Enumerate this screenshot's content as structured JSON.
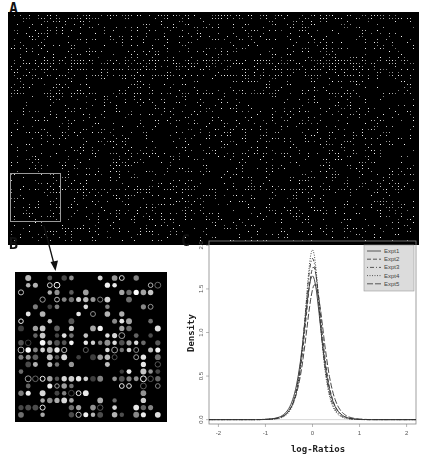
{
  "figure": {
    "panel_labels": {
      "a": "A",
      "b": "B",
      "c": "C"
    },
    "panel_a": {
      "description": "Full microarray scan image (dark background with bright spots)",
      "background": "#000000",
      "spot_color": "#e8e8e8",
      "highlight_box_color": "#9a9a9a"
    },
    "panel_b": {
      "description": "Enlarged sub-grid of microarray spots",
      "background": "#000000",
      "rows": 20,
      "cols": 20
    },
    "arrow": {
      "from": "panel-a-highlight",
      "to": "panel-b",
      "color": "#111111"
    }
  },
  "chart_data": {
    "type": "line",
    "title": "",
    "xlabel": "log-Ratios",
    "ylabel": "Density",
    "xlim": [
      -2.2,
      2.2
    ],
    "ylim": [
      -0.05,
      2.05
    ],
    "xticks": [
      "-2",
      "-1",
      "0",
      "1",
      "2"
    ],
    "yticks": [
      "0.0",
      "0.5",
      "1.0",
      "1.5",
      "2.0"
    ],
    "grid": false,
    "legend_position": "top-right",
    "horizontal_reference_line": 0,
    "series": [
      {
        "name": "Expt1",
        "style": "solid",
        "peak_x": 0.0,
        "peak_density": 1.65,
        "approx_sd": 0.21
      },
      {
        "name": "Expt2",
        "style": "dashed",
        "peak_x": 0.02,
        "peak_density": 1.75,
        "approx_sd": 0.2
      },
      {
        "name": "Expt3",
        "style": "dotdash",
        "peak_x": 0.0,
        "peak_density": 1.85,
        "approx_sd": 0.19
      },
      {
        "name": "Expt4",
        "style": "dotted",
        "peak_x": 0.0,
        "peak_density": 1.95,
        "approx_sd": 0.18
      },
      {
        "name": "Expt5",
        "style": "longdash",
        "peak_x": 0.05,
        "peak_density": 1.55,
        "approx_sd": 0.22
      }
    ]
  }
}
